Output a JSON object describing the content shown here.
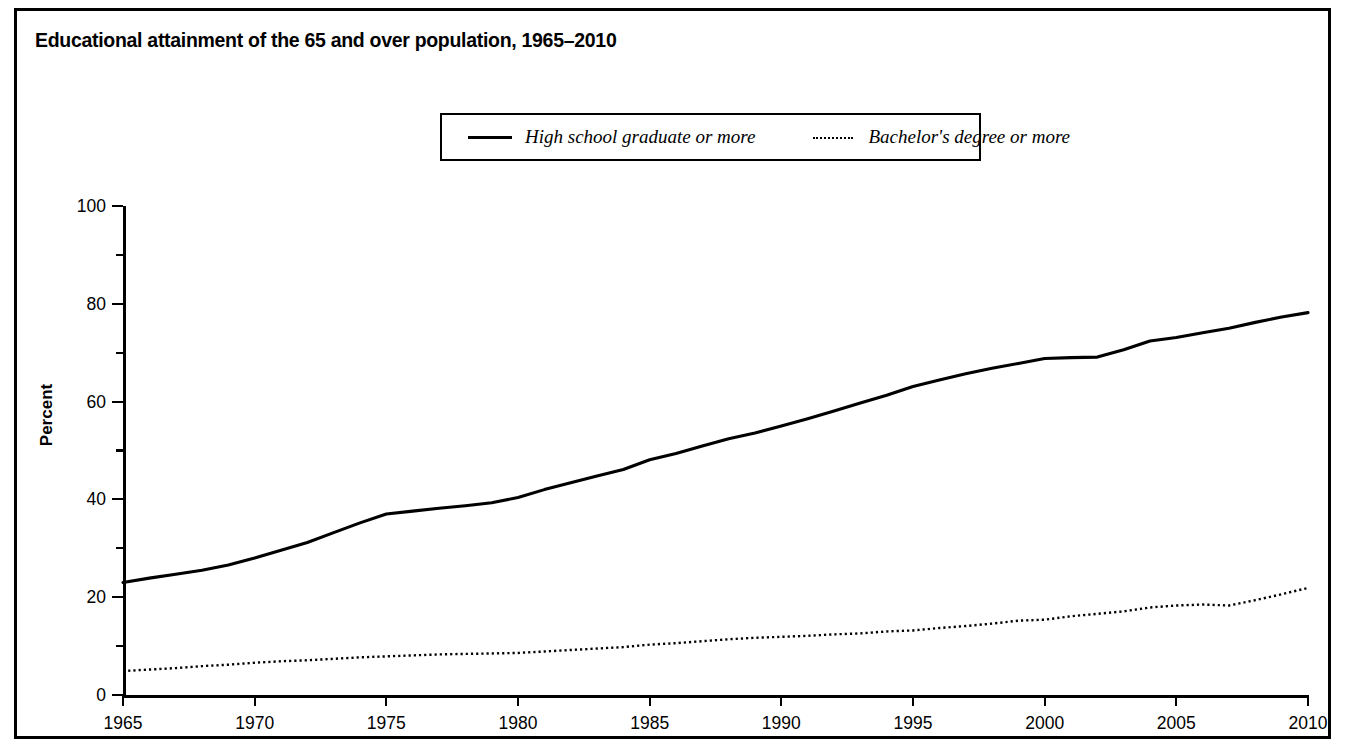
{
  "figure": {
    "title": "Educational attainment of the 65 and over population, 1965–2010",
    "border_color": "#000000",
    "background": "#ffffff"
  },
  "legend": {
    "position": "top-center",
    "entries": [
      {
        "label": "High school graduate or more",
        "style": "solid",
        "color": "#000000",
        "icon": "solid-line-swatch"
      },
      {
        "label": "Bachelor's degree or more",
        "style": "dotted",
        "color": "#000000",
        "icon": "dotted-line-swatch"
      }
    ]
  },
  "axes": {
    "y": {
      "title": "Percent",
      "ticks": [
        "0",
        "20",
        "40",
        "60",
        "80",
        "100"
      ],
      "minor_ticks": [
        "10",
        "30",
        "50",
        "70",
        "90"
      ],
      "min": 0,
      "max": 100
    },
    "x": {
      "title": "",
      "ticks": [
        "1965",
        "1970",
        "1975",
        "1980",
        "1985",
        "1990",
        "1995",
        "2000",
        "2005",
        "2010"
      ],
      "min": 1965,
      "max": 2010
    }
  },
  "chart_data": {
    "type": "line",
    "title": "Educational attainment of the 65 and over population, 1965–2010",
    "xlabel": "",
    "ylabel": "Percent",
    "xlim": [
      1965,
      2010
    ],
    "ylim": [
      0,
      100
    ],
    "grid": false,
    "legend_position": "top-center",
    "x": [
      1965,
      1966,
      1967,
      1968,
      1969,
      1970,
      1971,
      1972,
      1973,
      1974,
      1975,
      1976,
      1977,
      1978,
      1979,
      1980,
      1981,
      1982,
      1983,
      1984,
      1985,
      1986,
      1987,
      1988,
      1989,
      1990,
      1991,
      1992,
      1993,
      1994,
      1995,
      1996,
      1997,
      1998,
      1999,
      2000,
      2001,
      2002,
      2003,
      2004,
      2005,
      2006,
      2007,
      2008,
      2009,
      2010
    ],
    "series": [
      {
        "name": "High school graduate or more",
        "style": "solid",
        "color": "#000000",
        "values": [
          23.0,
          23.9,
          24.7,
          25.5,
          26.6,
          28.0,
          29.6,
          31.2,
          33.2,
          35.2,
          37.0,
          37.6,
          38.2,
          38.7,
          39.3,
          40.4,
          42.0,
          43.4,
          44.8,
          46.1,
          48.1,
          49.4,
          50.9,
          52.4,
          53.6,
          55.0,
          56.5,
          58.1,
          59.7,
          61.3,
          63.1,
          64.4,
          65.7,
          66.8,
          67.8,
          68.8,
          69.0,
          69.1,
          70.6,
          72.4,
          73.1,
          74.1,
          75.0,
          76.2,
          77.3,
          78.2
        ]
      },
      {
        "name": "Bachelor's degree or more",
        "style": "dotted",
        "color": "#000000",
        "values": [
          4.9,
          5.2,
          5.5,
          5.9,
          6.2,
          6.6,
          6.9,
          7.1,
          7.4,
          7.7,
          7.9,
          8.1,
          8.3,
          8.4,
          8.5,
          8.6,
          8.9,
          9.2,
          9.5,
          9.8,
          10.3,
          10.6,
          11.0,
          11.4,
          11.7,
          11.9,
          12.1,
          12.4,
          12.6,
          13.0,
          13.2,
          13.7,
          14.1,
          14.6,
          15.2,
          15.4,
          16.1,
          16.6,
          17.1,
          17.9,
          18.3,
          18.5,
          18.3,
          19.4,
          20.6,
          21.9
        ]
      }
    ]
  }
}
